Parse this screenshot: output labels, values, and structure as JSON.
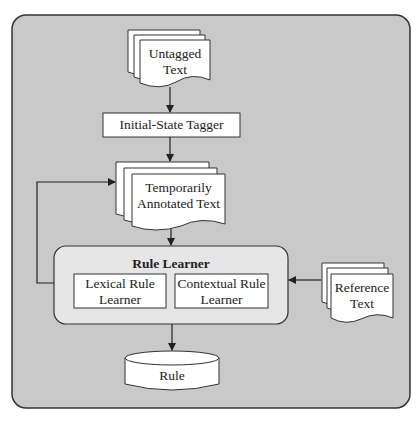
{
  "diagram": {
    "title": "",
    "colors": {
      "frame_fill": "#c9c9c9",
      "frame_stroke": "#333333",
      "node_fill": "#ffffff",
      "rule_learner_fill": "#e6e6e6",
      "line": "#222222"
    },
    "nodes": {
      "untagged_text": {
        "type": "document-stack",
        "line1": "Untagged",
        "line2": "Text"
      },
      "initial_state_tagger": {
        "type": "process",
        "label": "Initial-State Tagger"
      },
      "temporarily_annotated_text": {
        "type": "document-stack",
        "line1": "Temporarily",
        "line2": "Annotated Text"
      },
      "rule_learner": {
        "type": "group",
        "label": "Rule Learner",
        "children": {
          "lexical": {
            "line1": "Lexical Rule",
            "line2": "Learner"
          },
          "contextual": {
            "line1": "Contextual Rule",
            "line2": "Learner"
          }
        }
      },
      "reference_text": {
        "type": "document-stack",
        "line1": "Reference",
        "line2": "Text"
      },
      "rule": {
        "type": "database",
        "label": "Rule"
      }
    },
    "edges": [
      {
        "from": "Untagged Text",
        "to": "Initial-State Tagger"
      },
      {
        "from": "Initial-State Tagger",
        "to": "Temporarily Annotated Text"
      },
      {
        "from": "Temporarily Annotated Text",
        "to": "Rule Learner"
      },
      {
        "from": "Rule Learner",
        "to": "Temporarily Annotated Text",
        "kind": "feedback-loop"
      },
      {
        "from": "Reference Text",
        "to": "Rule Learner"
      },
      {
        "from": "Rule Learner",
        "to": "Rule"
      }
    ]
  }
}
